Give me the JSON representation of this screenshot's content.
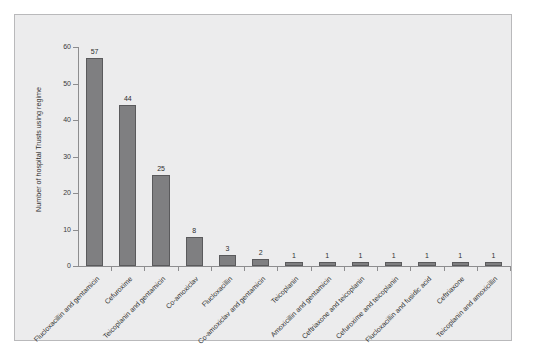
{
  "figure": {
    "background_color": "#ffffff",
    "panel_color": "#ececed",
    "bar_color": "#7f7f81",
    "bar_border_color": "#5a5a5c",
    "axis_color": "#8d8d8f"
  },
  "chart_data": {
    "type": "bar",
    "title": "",
    "xlabel": "",
    "ylabel": "Number of hospital Trusts using regime",
    "ylim": [
      0,
      60
    ],
    "yticks": [
      0,
      10,
      20,
      30,
      40,
      50,
      60
    ],
    "ytick_labels": [
      "0",
      "10",
      "20",
      "30",
      "40",
      "50",
      "60"
    ],
    "grid": false,
    "legend": false,
    "categories": [
      "Flucloxacillin and gentamicin",
      "Cefuroxime",
      "Teicoplanin and gentamicin",
      "Co-amoxiclav",
      "Flucloxacillin",
      "Co-amoxiclav and gentamicin",
      "Teicoplanin",
      "Amoxicillin and gentamicin",
      "Ceftriaxone and teicoplanin",
      "Cefuroxime and teicoplanin",
      "Flucloxacillin and fusidic acid",
      "Ceftriaxone",
      "Teicoplanin and amoxicillin"
    ],
    "values": [
      57,
      44,
      25,
      8,
      3,
      2,
      1,
      1,
      1,
      1,
      1,
      1,
      1
    ],
    "data_labels": [
      "57",
      "44",
      "25",
      "8",
      "3",
      "2",
      "1",
      "1",
      "1",
      "1",
      "1",
      "1",
      "1"
    ]
  }
}
